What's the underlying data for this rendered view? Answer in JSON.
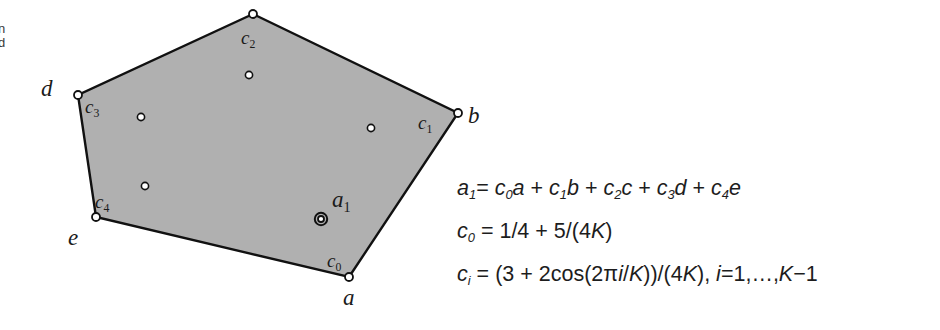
{
  "figure": {
    "background_color": "#ffffff",
    "polygon_fill": "#b0b0b0",
    "polygon_stroke": "#111111",
    "marker_fill": "#ffffff",
    "marker_stroke": "#111111"
  },
  "edge_fragment": {
    "line1": "n",
    "line2": "d"
  },
  "polygon": {
    "name": "control-polygon",
    "vertices": [
      {
        "label": "a",
        "control_label": "c",
        "control_sub": "0",
        "x": 349,
        "y": 277
      },
      {
        "label": "b",
        "control_label": "c",
        "control_sub": "1",
        "x": 458,
        "y": 113
      },
      {
        "label": "c",
        "control_label": "c",
        "control_sub": "2",
        "x": 253,
        "y": 14
      },
      {
        "label": "d",
        "control_label": "c",
        "control_sub": "3",
        "x": 78,
        "y": 95
      },
      {
        "label": "e",
        "control_label": "c",
        "control_sub": "4",
        "x": 96,
        "y": 217
      }
    ]
  },
  "vertex_labels": [
    {
      "name": "vertex-label-a",
      "text": "a",
      "x": 343,
      "y": 286
    },
    {
      "name": "vertex-label-b",
      "text": "b",
      "x": 468,
      "y": 104
    },
    {
      "name": "vertex-label-d",
      "text": "d",
      "x": 41,
      "y": 77
    },
    {
      "name": "vertex-label-e",
      "text": "e",
      "x": 68,
      "y": 226
    }
  ],
  "control_labels": [
    {
      "name": "control-label-c0",
      "base": "c",
      "sub": "0",
      "x": 327,
      "y": 251
    },
    {
      "name": "control-label-c1",
      "base": "c",
      "sub": "1",
      "x": 418,
      "y": 113
    },
    {
      "name": "control-label-c2",
      "base": "c",
      "sub": "2",
      "x": 241,
      "y": 28
    },
    {
      "name": "control-label-c3",
      "base": "c",
      "sub": "3",
      "x": 85,
      "y": 97
    },
    {
      "name": "control-label-c4",
      "base": "c",
      "sub": "4",
      "x": 95,
      "y": 192
    }
  ],
  "interior_points": [
    {
      "name": "interior-point-1",
      "x": 249,
      "y": 75
    },
    {
      "name": "interior-point-2",
      "x": 141,
      "y": 117
    },
    {
      "name": "interior-point-3",
      "x": 371,
      "y": 128
    },
    {
      "name": "interior-point-4",
      "x": 145,
      "y": 186
    }
  ],
  "new_point": {
    "name": "new-point-a1",
    "x": 321,
    "y": 219,
    "label_base": "a",
    "label_sub": "1",
    "label_x": 332,
    "label_y": 188
  },
  "formulas": {
    "line1": {
      "name": "formula-a1",
      "parts": [
        {
          "t": "a",
          "i": true
        },
        {
          "t": "1",
          "sub": true
        },
        {
          "t": "= ",
          "i": false
        },
        {
          "t": "c",
          "i": true
        },
        {
          "t": "0",
          "sub": true
        },
        {
          "t": "a",
          "i": true
        },
        {
          "t": " + ",
          "i": false
        },
        {
          "t": "c",
          "i": true
        },
        {
          "t": "1",
          "sub": true
        },
        {
          "t": "b",
          "i": true
        },
        {
          "t": " + ",
          "i": false
        },
        {
          "t": "c",
          "i": true
        },
        {
          "t": "2",
          "sub": true
        },
        {
          "t": "c",
          "i": true
        },
        {
          "t": " + ",
          "i": false
        },
        {
          "t": "c",
          "i": true
        },
        {
          "t": "3",
          "sub": true
        },
        {
          "t": "d",
          "i": true
        },
        {
          "t": " + ",
          "i": false
        },
        {
          "t": "c",
          "i": true
        },
        {
          "t": "4",
          "sub": true
        },
        {
          "t": "e",
          "i": true
        }
      ],
      "plain": "a1= c0a + c1b + c2c + c3d + c4e"
    },
    "line2": {
      "name": "formula-c0",
      "parts": [
        {
          "t": "c",
          "i": true
        },
        {
          "t": "0",
          "sub": true
        },
        {
          "t": " = 1/4 + 5/(4",
          "i": false
        },
        {
          "t": "K",
          "i": true
        },
        {
          "t": ")",
          "i": false
        }
      ],
      "plain": "c0 = 1/4 + 5/(4K)"
    },
    "line3": {
      "name": "formula-ci",
      "parts": [
        {
          "t": "c",
          "i": true
        },
        {
          "t": "i",
          "sub": true
        },
        {
          "t": " = (3 + 2cos(2π",
          "i": false
        },
        {
          "t": "i",
          "i": true
        },
        {
          "t": "/",
          "i": false
        },
        {
          "t": "K",
          "i": true
        },
        {
          "t": "))/(4",
          "i": false
        },
        {
          "t": "K",
          "i": true
        },
        {
          "t": "), ",
          "i": false
        },
        {
          "t": "i",
          "i": true
        },
        {
          "t": "=1,…,",
          "i": false
        },
        {
          "t": "K",
          "i": true
        },
        {
          "t": "−1",
          "i": false
        }
      ],
      "plain": "ci = (3 + 2cos(2πi/K))/(4K), i=1,…,K−1"
    }
  }
}
